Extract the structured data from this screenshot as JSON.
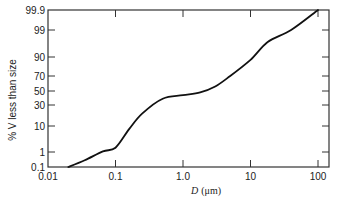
{
  "chart_data": {
    "type": "line",
    "title": "",
    "xlabel": "D (μm)",
    "xlabel_italic_part": "D",
    "xlabel_unit_part": "(μm)",
    "ylabel": "% V less than size",
    "x_scale": "log",
    "y_scale": "probability",
    "xlim": [
      0.01,
      130
    ],
    "ylim": [
      0.1,
      99.9
    ],
    "x_ticks": [
      0.01,
      0.1,
      1.0,
      10,
      100
    ],
    "x_tick_labels": [
      "0.01",
      "0.1",
      "1.0",
      "10",
      "100"
    ],
    "y_ticks": [
      0.1,
      1,
      10,
      30,
      50,
      70,
      90,
      99,
      99.9
    ],
    "y_tick_labels": [
      "0.1",
      "1",
      "10",
      "30",
      "50",
      "70",
      "90",
      "99",
      "99.9"
    ],
    "grid": false,
    "legend": null,
    "series": [
      {
        "name": "cumulative volume distribution",
        "x": [
          0.02,
          0.035,
          0.065,
          0.1,
          0.16,
          0.25,
          0.5,
          1.0,
          1.8,
          3,
          5,
          10,
          18,
          40,
          100
        ],
        "y": [
          0.1,
          0.5,
          1.2,
          2.5,
          9,
          22,
          39,
          44,
          48,
          56,
          70,
          87,
          95,
          99,
          99.9
        ]
      }
    ]
  },
  "caption": {
    "text": ""
  },
  "style": {
    "line_color": "#111111",
    "axis_color": "#333333"
  }
}
